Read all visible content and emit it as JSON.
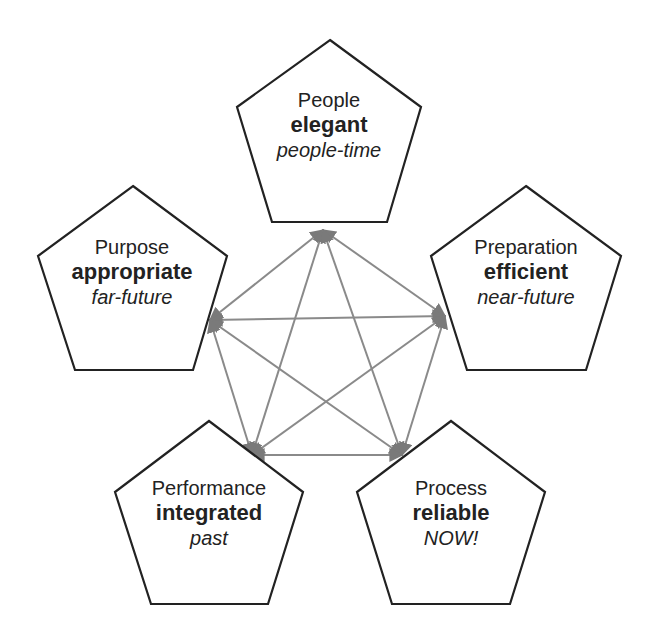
{
  "diagram": {
    "type": "pentagram-network",
    "line_color": "#8a8a8a",
    "border_color": "#222222",
    "nodes": [
      {
        "id": "people",
        "name": "People",
        "quality": "elegant",
        "time": "people-time"
      },
      {
        "id": "preparation",
        "name": "Preparation",
        "quality": "efficient",
        "time": "near-future"
      },
      {
        "id": "process",
        "name": "Process",
        "quality": "reliable",
        "time": "NOW!"
      },
      {
        "id": "performance",
        "name": "Performance",
        "quality": "integrated",
        "time": "past"
      },
      {
        "id": "purpose",
        "name": "Purpose",
        "quality": "appropriate",
        "time": "far-future"
      }
    ],
    "connections": "every node connected to every other node with bidirectional arrows"
  }
}
